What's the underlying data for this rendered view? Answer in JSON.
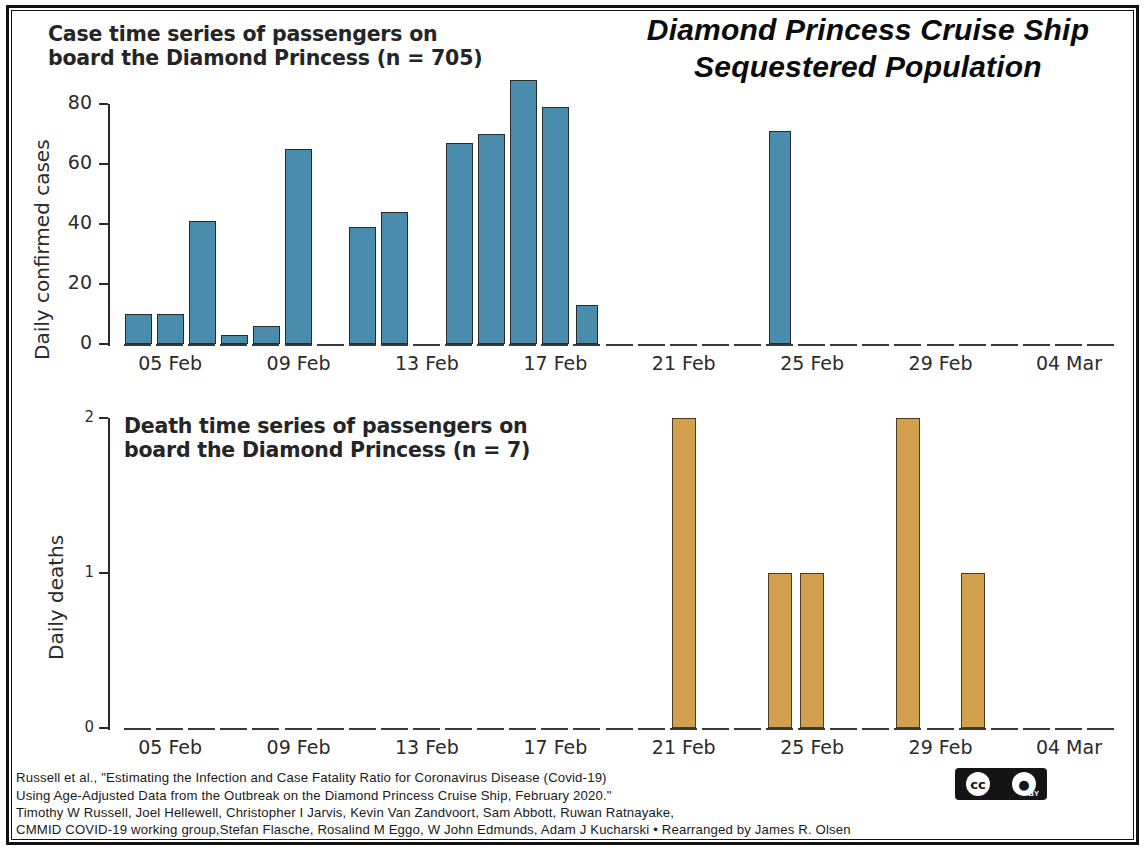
{
  "poster": {
    "main_title_line1": "Diamond Princess Cruise Ship",
    "main_title_line2": "Sequestered Population"
  },
  "cases_panel": {
    "title": "Case time series of passengers on\nboard the Diamond Princess (n = 705)",
    "ylabel": "Daily confirmed cases",
    "ytick_labels": [
      "80",
      "60",
      "40",
      "20",
      "0"
    ]
  },
  "deaths_panel": {
    "title": "Death time series of passengers on\nboard the Diamond Princess (n = 7)",
    "ylabel": "Daily deaths",
    "ytick_labels": [
      "2",
      "1",
      "0"
    ]
  },
  "xaxis": {
    "tick_labels": [
      "05 Feb",
      "09 Feb",
      "13 Feb",
      "17 Feb",
      "21 Feb",
      "25 Feb",
      "29 Feb",
      "04 Mar"
    ]
  },
  "footer": {
    "text": "Russell et al., \"Estimating the Infection and Case Fatality Ratio for Coronavirus Disease (Covid-19)\nUsing Age-Adjusted Data from the Outbreak on the Diamond Princess Cruise Ship, February 2020.\"\nTimothy W Russell, Joel Hellewell, Christopher I Jarvis, Kevin Van Zandvoort, Sam Abbott, Ruwan Ratnayake,\nCMMID COVID-19 working group,Stefan Flasche, Rosalind M Eggo, W John Edmunds, Adam J Kucharski • Rearranged by James R. Olsen",
    "license_mark": "cc",
    "license_by": "BY"
  },
  "colors": {
    "case_bar": "#4a8cac",
    "death_bar": "#d2a14f",
    "bar_edge": "#2a2a2a",
    "axis": "#2b2b2b",
    "frame": "#111111"
  },
  "chart_data": [
    {
      "type": "bar",
      "title": "Case time series of passengers on board the Diamond Princess (n = 705)",
      "xlabel": "",
      "ylabel": "Daily confirmed cases",
      "ylim": [
        0,
        80
      ],
      "yticks": [
        0,
        20,
        40,
        60,
        80
      ],
      "grid": false,
      "legend": "none",
      "color": "#4a8cac",
      "categories": [
        "04 Feb",
        "05 Feb",
        "06 Feb",
        "07 Feb",
        "08 Feb",
        "09 Feb",
        "10 Feb",
        "11 Feb",
        "12 Feb",
        "13 Feb",
        "14 Feb",
        "15 Feb",
        "16 Feb",
        "17 Feb",
        "18 Feb",
        "19 Feb",
        "20 Feb",
        "21 Feb",
        "22 Feb",
        "23 Feb",
        "24 Feb",
        "25 Feb",
        "26 Feb",
        "27 Feb",
        "28 Feb",
        "29 Feb",
        "01 Mar",
        "02 Mar",
        "03 Mar",
        "04 Mar",
        "05 Mar"
      ],
      "values": [
        10,
        10,
        41,
        3,
        6,
        65,
        0,
        39,
        44,
        0,
        67,
        70,
        88,
        79,
        0,
        0,
        0,
        0,
        0,
        0,
        0,
        0,
        0,
        0,
        0,
        0,
        0,
        0,
        0,
        0,
        0
      ],
      "values_note": "bars plotted left-to-right at one-day spacing beginning 04 Feb",
      "series": [
        {
          "name": "Daily confirmed cases",
          "points": [
            {
              "date": "04 Feb",
              "value": 10
            },
            {
              "date": "05 Feb",
              "value": 10
            },
            {
              "date": "06 Feb",
              "value": 41
            },
            {
              "date": "07 Feb",
              "value": 3
            },
            {
              "date": "08 Feb",
              "value": 6
            },
            {
              "date": "09 Feb",
              "value": 65
            },
            {
              "date": "10 Feb",
              "value": 0
            },
            {
              "date": "11 Feb",
              "value": 39
            },
            {
              "date": "12 Feb",
              "value": 44
            },
            {
              "date": "13 Feb",
              "value": 0
            },
            {
              "date": "14 Feb",
              "value": 67
            },
            {
              "date": "15 Feb",
              "value": 70
            },
            {
              "date": "16 Feb",
              "value": 88
            },
            {
              "date": "17 Feb",
              "value": 79
            },
            {
              "date": "18 Feb",
              "value": 13
            },
            {
              "date": "19 Feb",
              "value": 0
            },
            {
              "date": "20 Feb",
              "value": 0
            },
            {
              "date": "21 Feb",
              "value": 0
            },
            {
              "date": "22 Feb",
              "value": 0
            },
            {
              "date": "23 Feb",
              "value": 0
            },
            {
              "date": "24 Feb",
              "value": 71
            },
            {
              "date": "25 Feb",
              "value": 0
            },
            {
              "date": "26 Feb",
              "value": 0
            },
            {
              "date": "27 Feb",
              "value": 0
            },
            {
              "date": "28 Feb",
              "value": 0
            },
            {
              "date": "29 Feb",
              "value": 0
            },
            {
              "date": "01 Mar",
              "value": 0
            },
            {
              "date": "02 Mar",
              "value": 0
            },
            {
              "date": "03 Mar",
              "value": 0
            },
            {
              "date": "04 Mar",
              "value": 0
            }
          ]
        }
      ]
    },
    {
      "type": "bar",
      "title": "Death time series of passengers on board the Diamond Princess (n = 7)",
      "xlabel": "",
      "ylabel": "Daily deaths",
      "ylim": [
        0,
        2
      ],
      "yticks": [
        0,
        1,
        2
      ],
      "grid": false,
      "legend": "none",
      "color": "#d2a14f",
      "categories": [
        "21 Feb",
        "24 Feb",
        "25 Feb",
        "28 Feb",
        "01 Mar"
      ],
      "values": [
        2,
        1,
        1,
        2,
        1
      ],
      "series": [
        {
          "name": "Daily deaths",
          "points": [
            {
              "date": "21 Feb",
              "value": 2
            },
            {
              "date": "24 Feb",
              "value": 1
            },
            {
              "date": "25 Feb",
              "value": 1
            },
            {
              "date": "28 Feb",
              "value": 2
            },
            {
              "date": "01 Mar",
              "value": 1
            }
          ]
        }
      ]
    }
  ]
}
